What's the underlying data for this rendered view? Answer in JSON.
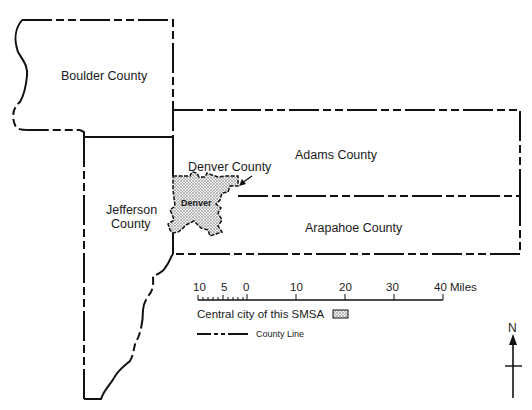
{
  "map": {
    "counties": [
      {
        "id": "boulder",
        "label": "Boulder County"
      },
      {
        "id": "adams",
        "label": "Adams County"
      },
      {
        "id": "jefferson",
        "label_line1": "Jefferson",
        "label_line2": "County"
      },
      {
        "id": "arapahoe",
        "label": "Arapahoe County"
      },
      {
        "id": "denver",
        "label": "Denver County"
      }
    ],
    "central_city": {
      "label": "Denver"
    }
  },
  "scale_bar": {
    "ticks": [
      "10",
      "5",
      "0",
      "10",
      "20",
      "30",
      "40 Miles"
    ]
  },
  "legend": {
    "central_city_label": "Central city of this SMSA",
    "county_line_label": "County Line"
  },
  "compass": {
    "north_label": "N"
  },
  "colors": {
    "ink": "#111111",
    "background": "#ffffff",
    "stipple": "#c8c8c8"
  }
}
